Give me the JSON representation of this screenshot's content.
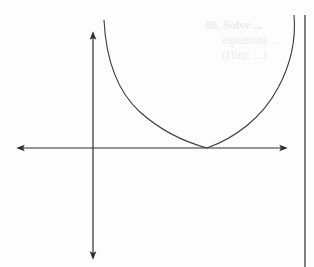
{
  "figure": {
    "type": "graph-of-curve",
    "colors": {
      "line": "#3a3a3a",
      "axis": "#2e2e2e",
      "background": "#fdfdfd",
      "bleed_text": "#ececec"
    },
    "axes": {
      "horizontal": {
        "x1": 18,
        "x2": 286,
        "y": 148
      },
      "vertical": {
        "x": 93,
        "y1": 33,
        "y2": 258
      }
    },
    "curve": {
      "left_branch_start": [
        104,
        20
      ],
      "vertex": [
        207,
        148
      ],
      "right_branch_end": [
        294,
        15
      ]
    },
    "page_margin_rule": {
      "x": 305,
      "y1": 15,
      "y2": 267
    }
  },
  "bleed_through_text": {
    "line1": "86.  Solve ... ",
    "line2": "equations ...",
    "line3": "(Hint: ...)"
  }
}
